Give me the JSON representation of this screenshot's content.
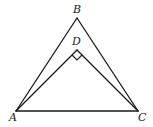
{
  "diagram": {
    "type": "geometry",
    "points": {
      "A": {
        "label": "A",
        "x": 16,
        "y": 111,
        "label_x": 9,
        "label_y": 121
      },
      "B": {
        "label": "B",
        "x": 77,
        "y": 18,
        "label_x": 73,
        "label_y": 13
      },
      "C": {
        "label": "C",
        "x": 138,
        "y": 111,
        "label_x": 138,
        "label_y": 121
      },
      "D": {
        "label": "D",
        "x": 77,
        "y": 50,
        "label_x": 72,
        "label_y": 45
      }
    },
    "segments": [
      {
        "from": "A",
        "to": "B"
      },
      {
        "from": "B",
        "to": "C"
      },
      {
        "from": "A",
        "to": "C"
      },
      {
        "from": "A",
        "to": "D"
      },
      {
        "from": "D",
        "to": "C"
      }
    ],
    "right_angle_at": "D",
    "stroke_color": "#1a1a1a"
  }
}
